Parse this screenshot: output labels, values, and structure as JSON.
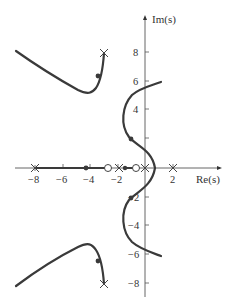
{
  "diagram": {
    "type": "root-locus",
    "axes": {
      "x_label": "Re(s)",
      "y_label": "Im(s)",
      "x_ticks": [
        "−8",
        "−6",
        "−4",
        "−2",
        "2"
      ],
      "y_ticks": [
        "8",
        "6",
        "4",
        "2",
        "−2",
        "−4",
        "−6",
        "−8"
      ]
    },
    "poles": [
      {
        "re": -8,
        "im": 0
      },
      {
        "re": -1.7,
        "im": 0
      },
      {
        "re": 0,
        "im": 0
      },
      {
        "re": 2,
        "im": 0
      },
      {
        "re": -2.5,
        "im": 8
      },
      {
        "re": -2.5,
        "im": -8
      }
    ],
    "zeros": [
      {
        "re": -2.8,
        "im": 0
      },
      {
        "re": -0.8,
        "im": 0
      }
    ],
    "colors": {
      "locus": "#3a3a3a",
      "axis": "#555555",
      "text": "#333333"
    }
  }
}
